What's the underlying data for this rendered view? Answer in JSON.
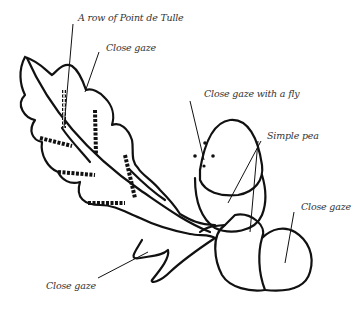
{
  "labels": {
    "row_point_de_tulle": "A row of Point de Tulle",
    "close_gaze_leaf": "Close gaze",
    "close_gaze_fly": "Close gaze with a fly",
    "simple_pea": "Simple pea",
    "close_gaze_acorn": "Close gaze",
    "close_gaze_stem": "Close gaze"
  },
  "colors": {
    "stroke": "#111111",
    "text": "#333333",
    "background": "#ffffff"
  }
}
